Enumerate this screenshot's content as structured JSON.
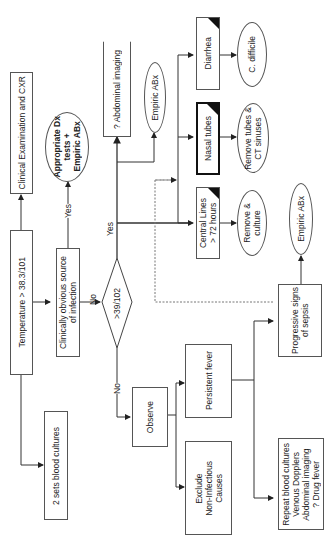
{
  "diagram": {
    "orientation": "rotated-90-ccw",
    "nodes": {
      "clinical_exam": "Clinical Examination and CXR",
      "temperature": "Temperature > 38.3/101",
      "blood_cultures": "2 sets blood cultures",
      "appropriate_dx": "Appropriate Dx\ntests +\nEmpiric ABx",
      "obvious_source": "Clinically obvious source\nof infection",
      "decision_39": ">39/102",
      "abdominal_imaging": "? Abdominal imaging",
      "empiric_abx_top": "Empiric ABx",
      "diarrhea": "Diarrhea",
      "c_difficile": "C. difficile",
      "nasal_tubes": "Nasal tubes",
      "remove_tubes": "Remove tubes &\nCT sinuses",
      "central_lines": "Central Lines\n> 72 hours",
      "remove_culture": "Remove &\nculture",
      "empiric_abx_right": "Empiric ABx",
      "progressive_sepsis": "Progressive signs\nof sepsis",
      "observe": "Observe",
      "persistent_fever": "Persistent fever",
      "exclude_noninfectious": "Exclude\nNon-Infectious\nCauses",
      "repeat_workup": "Repeat blood cultures\nVenous Dopplers\nAbdominal imaging\n? Drug fever"
    },
    "edge_labels": {
      "yes_source": "Yes",
      "no_source": "No",
      "yes_39": "Yes",
      "no_39": "No"
    },
    "colors": {
      "line": "#333333",
      "dotted": "#777777",
      "corner": "#111111"
    }
  }
}
